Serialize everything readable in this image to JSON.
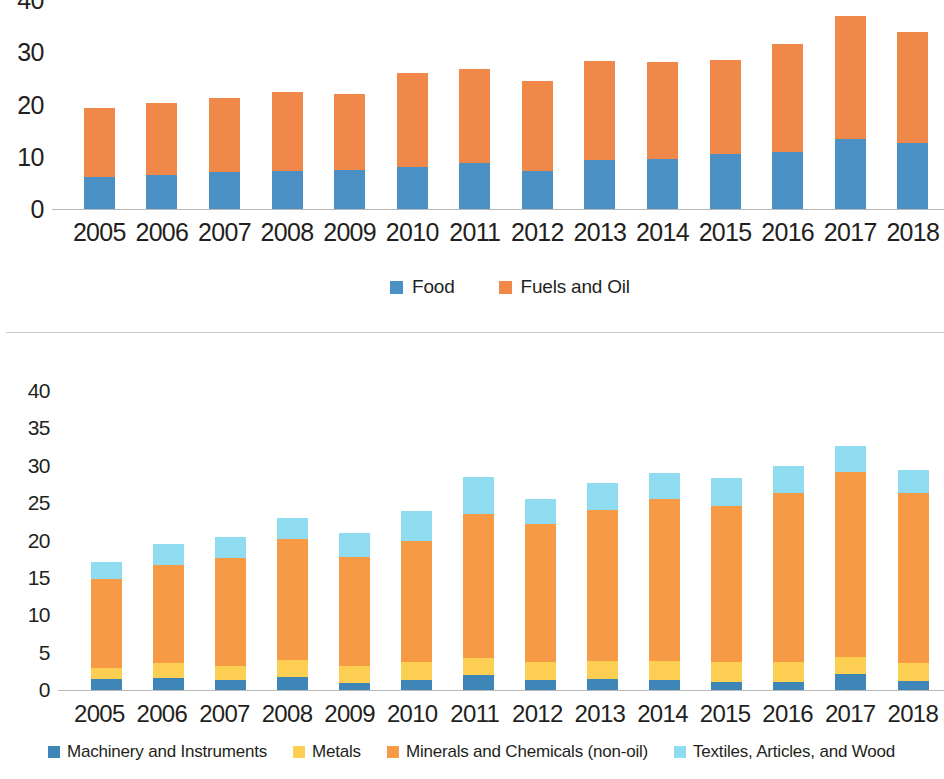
{
  "colors": {
    "food_blue": "#4a90c4",
    "fuels_orange": "#f0884a",
    "machinery_blue": "#3f86b8",
    "metals_yellow": "#fcce52",
    "minerals_orange": "#f79a46",
    "textiles_cyan": "#8fdcf0",
    "axis_text": "#231f20",
    "baseline": "#b9b9ba",
    "divider": "#c9c9cb"
  },
  "chart_data": [
    {
      "id": "top",
      "type": "bar",
      "stacked": true,
      "title": "",
      "xlabel": "",
      "ylabel": "",
      "ylim": [
        0,
        40
      ],
      "yticks": [
        0,
        10,
        20,
        30,
        40
      ],
      "grid": false,
      "legend_position": "bottom-center",
      "categories": [
        "2005",
        "2006",
        "2007",
        "2008",
        "2009",
        "2010",
        "2011",
        "2012",
        "2013",
        "2014",
        "2015",
        "2016",
        "2017",
        "2018"
      ],
      "series": [
        {
          "name": "Food",
          "color": "#4a90c4",
          "values": [
            6.2,
            6.6,
            7.1,
            7.3,
            7.5,
            8.0,
            8.8,
            7.2,
            9.4,
            9.6,
            10.5,
            11.0,
            13.4,
            12.7
          ]
        },
        {
          "name": "Fuels and Oil",
          "color": "#f0884a",
          "values": [
            13.1,
            13.7,
            14.1,
            15.0,
            14.6,
            18.0,
            18.0,
            17.3,
            19.0,
            18.6,
            18.1,
            20.5,
            23.6,
            21.2
          ]
        }
      ],
      "totals": [
        19.3,
        20.3,
        21.2,
        22.3,
        22.1,
        26.0,
        26.8,
        24.5,
        28.4,
        28.2,
        28.6,
        31.5,
        37.0,
        33.9
      ]
    },
    {
      "id": "bottom",
      "type": "bar",
      "stacked": true,
      "title": "",
      "xlabel": "",
      "ylabel": "",
      "ylim": [
        0,
        40
      ],
      "yticks": [
        0,
        5,
        10,
        15,
        20,
        25,
        30,
        35,
        40
      ],
      "grid": false,
      "legend_position": "bottom",
      "categories": [
        "2005",
        "2006",
        "2007",
        "2008",
        "2009",
        "2010",
        "2011",
        "2012",
        "2013",
        "2014",
        "2015",
        "2016",
        "2017",
        "2018"
      ],
      "series": [
        {
          "name": "Machinery and Instruments",
          "color": "#3f86b8",
          "values": [
            1.5,
            1.6,
            1.3,
            1.7,
            1.0,
            1.4,
            2.0,
            1.3,
            1.5,
            1.4,
            1.1,
            1.1,
            2.1,
            1.2
          ]
        },
        {
          "name": "Metals",
          "color": "#fcce52",
          "values": [
            1.5,
            2.0,
            1.9,
            2.3,
            2.2,
            2.4,
            2.3,
            2.4,
            2.4,
            2.5,
            2.6,
            2.6,
            2.3,
            2.4
          ]
        },
        {
          "name": "Minerals and Chemicals (non-oil)",
          "color": "#f79a46",
          "values": [
            11.8,
            13.1,
            14.5,
            16.2,
            14.6,
            16.2,
            19.2,
            18.5,
            20.2,
            21.7,
            20.9,
            22.6,
            24.8,
            22.7
          ]
        },
        {
          "name": "Textiles, Articles, and Wood",
          "color": "#8fdcf0",
          "values": [
            2.3,
            2.8,
            2.8,
            2.8,
            3.2,
            4.0,
            5.0,
            3.4,
            3.6,
            3.5,
            3.7,
            3.7,
            3.5,
            3.2
          ]
        }
      ],
      "totals": [
        17.1,
        19.5,
        20.5,
        23.0,
        21.0,
        24.0,
        28.5,
        25.6,
        27.7,
        29.1,
        28.3,
        30.0,
        32.7,
        29.5
      ]
    }
  ]
}
